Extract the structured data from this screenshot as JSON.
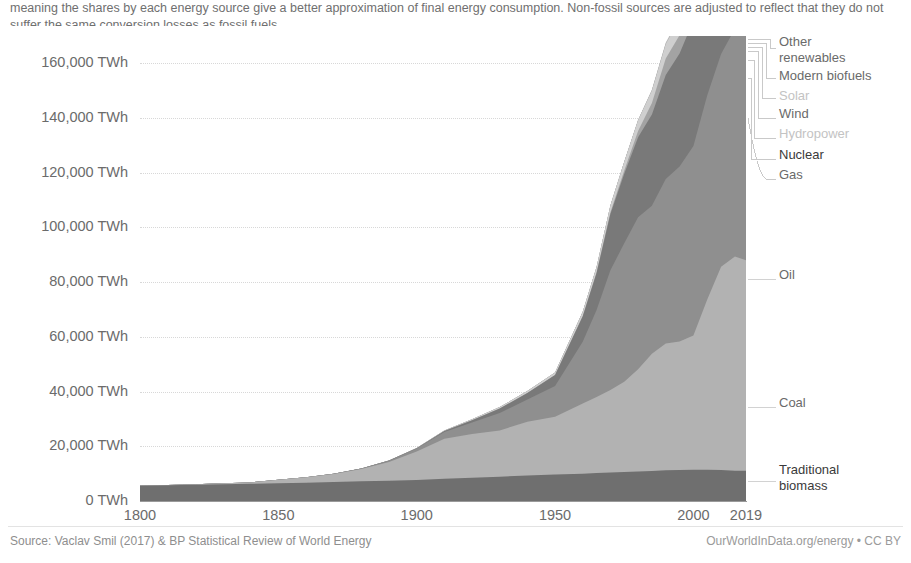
{
  "subtitle": {
    "text": "Primary energy consumption is measured in terawatt-hours (TWh). Here an inefficiency factor (the 'substitution' method) has been applied for fossil fuels, meaning the shares by each energy source give a better approximation of final energy consumption. Non-fossil sources are adjusted to reflect that they do not suffer the same conversion losses as fossil fuels.",
    "visible_tail": "losses as fossil fuels."
  },
  "footer": {
    "source": "Source: Vaclav Smil (2017) & BP Statistical Review of World Energy",
    "credit": "OurWorldInData.org/energy • CC BY"
  },
  "legend": {
    "items": [
      {
        "label": "Other\nrenewables",
        "tone": "mid"
      },
      {
        "label": "Modern biofuels",
        "tone": "mid"
      },
      {
        "label": "Solar",
        "tone": "faint"
      },
      {
        "label": "Wind",
        "tone": "mid"
      },
      {
        "label": "Hydropower",
        "tone": "faint"
      },
      {
        "label": "Nuclear",
        "tone": "bold"
      },
      {
        "label": "Gas",
        "tone": "mid"
      },
      {
        "label": "Oil",
        "tone": "mid"
      },
      {
        "label": "Coal",
        "tone": "mid"
      },
      {
        "label": "Traditional\nbiomass",
        "tone": "bold"
      }
    ]
  },
  "colors": {
    "traditional_biomass": "#6f6f6f",
    "coal": "#b2b2b2",
    "oil": "#8f8f8f",
    "gas": "#797979",
    "nuclear": "#a3a3a3",
    "hydropower": "#cfcfcf",
    "wind": "#8c8c8c",
    "solar": "#dcdcdc",
    "modern_biofuels": "#b8b8b8",
    "other_renewables": "#cdcdcd",
    "gridline": "#d8d8d8",
    "axis": "#9a9a9a",
    "text": "#6b6b6b"
  },
  "chart_data": {
    "type": "area",
    "xlabel": "",
    "ylabel": "",
    "unit": "TWh",
    "stacked": true,
    "grid": true,
    "legend_position": "right-outside",
    "xlim": [
      1800,
      2019
    ],
    "ylim": [
      0,
      170000
    ],
    "ytick_labels": [
      "0 TWh",
      "20,000 TWh",
      "40,000 TWh",
      "60,000 TWh",
      "80,000 TWh",
      "100,000 TWh",
      "120,000 TWh",
      "140,000 TWh",
      "160,000 TWh"
    ],
    "yticks": [
      0,
      20000,
      40000,
      60000,
      80000,
      100000,
      120000,
      140000,
      160000
    ],
    "xticks": [
      1800,
      1850,
      1900,
      1950,
      2000,
      2019
    ],
    "xtick_labels": [
      "1800",
      "1850",
      "1900",
      "1950",
      "2000",
      "2019"
    ],
    "x": [
      1800,
      1810,
      1820,
      1830,
      1840,
      1850,
      1860,
      1870,
      1880,
      1890,
      1900,
      1910,
      1920,
      1930,
      1940,
      1950,
      1960,
      1965,
      1970,
      1975,
      1980,
      1985,
      1990,
      1995,
      2000,
      2005,
      2010,
      2015,
      2019
    ],
    "series": [
      {
        "name": "Traditional biomass",
        "color": "#6f6f6f",
        "values": [
          5556,
          5746,
          5929,
          6114,
          6296,
          6482,
          6714,
          6958,
          7204,
          7448,
          7694,
          8096,
          8503,
          8903,
          9305,
          9704,
          10000,
          10200,
          10400,
          10600,
          10800,
          11000,
          11200,
          11300,
          11400,
          11400,
          11300,
          11100,
          11100
        ]
      },
      {
        "name": "Coal",
        "color": "#b2b2b2",
        "values": [
          97,
          147,
          222,
          333,
          500,
          1266,
          1936,
          2947,
          4487,
          6833,
          10400,
          14700,
          16000,
          16900,
          19700,
          21100,
          25600,
          27800,
          30200,
          33000,
          37400,
          42800,
          46400,
          47000,
          49100,
          62300,
          74300,
          78300,
          76900
        ]
      },
      {
        "name": "Oil",
        "color": "#8f8f8f",
        "values": [
          0,
          0,
          0,
          0,
          0,
          0,
          20,
          60,
          190,
          460,
          1080,
          2390,
          4180,
          6370,
          8100,
          11200,
          22600,
          31800,
          43800,
          50600,
          55500,
          54100,
          60100,
          64000,
          69300,
          74600,
          77800,
          83300,
          87200
        ]
      },
      {
        "name": "Gas",
        "color": "#797979",
        "values": [
          0,
          0,
          0,
          0,
          0,
          0,
          0,
          5,
          15,
          50,
          140,
          370,
          860,
          1620,
          2390,
          4030,
          9300,
          13600,
          20500,
          25400,
          29300,
          33400,
          38000,
          41300,
          45900,
          51200,
          56400,
          61500,
          65200
        ]
      },
      {
        "name": "Nuclear",
        "color": "#a3a3a3",
        "values": [
          0,
          0,
          0,
          0,
          0,
          0,
          0,
          0,
          0,
          0,
          0,
          0,
          0,
          0,
          0,
          0,
          60,
          180,
          650,
          1200,
          2300,
          4200,
          6100,
          6700,
          7300,
          7600,
          7400,
          6900,
          7300
        ]
      },
      {
        "name": "Hydropower",
        "color": "#cfcfcf",
        "values": [
          0,
          0,
          0,
          0,
          0,
          0,
          0,
          0,
          10,
          30,
          70,
          180,
          350,
          530,
          700,
          940,
          1600,
          2000,
          2500,
          3200,
          3900,
          4600,
          5300,
          6000,
          6700,
          7200,
          8300,
          9400,
          10100
        ]
      },
      {
        "name": "Wind",
        "color": "#8c8c8c",
        "values": [
          0,
          0,
          0,
          0,
          0,
          0,
          0,
          0,
          0,
          0,
          0,
          0,
          0,
          0,
          0,
          0,
          0,
          0,
          0,
          0,
          0,
          0,
          10,
          20,
          80,
          250,
          850,
          2100,
          3500
        ]
      },
      {
        "name": "Solar",
        "color": "#dcdcdc",
        "values": [
          0,
          0,
          0,
          0,
          0,
          0,
          0,
          0,
          0,
          0,
          0,
          0,
          0,
          0,
          0,
          0,
          0,
          0,
          0,
          0,
          0,
          0,
          0,
          0,
          5,
          20,
          90,
          700,
          2000
        ]
      },
      {
        "name": "Modern biofuels",
        "color": "#b8b8b8",
        "values": [
          0,
          0,
          0,
          0,
          0,
          0,
          0,
          0,
          0,
          0,
          0,
          0,
          0,
          0,
          0,
          0,
          0,
          0,
          0,
          0,
          30,
          100,
          200,
          320,
          480,
          750,
          1200,
          1500,
          1700
        ]
      },
      {
        "name": "Other renewables",
        "color": "#cdcdcd",
        "values": [
          0,
          0,
          0,
          0,
          0,
          0,
          0,
          0,
          0,
          0,
          0,
          0,
          0,
          0,
          0,
          0,
          10,
          20,
          40,
          70,
          120,
          200,
          320,
          450,
          600,
          820,
          1100,
          1500,
          1900
        ]
      }
    ],
    "totals_note": "Totals reach about 173,000 TWh in 2019"
  }
}
